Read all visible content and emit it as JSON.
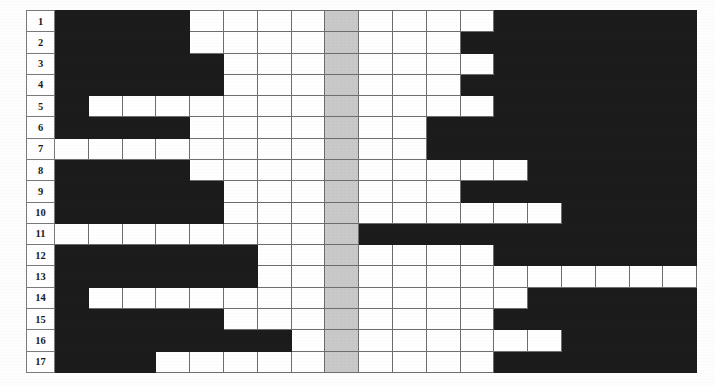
{
  "figure": {
    "kind": "pattern-grid",
    "rows": 17,
    "columns": 19,
    "highlight_column": 9,
    "colors": {
      "filled": "#1c1c1c",
      "empty": "#ffffff",
      "highlight": "#c9c9c9",
      "gridline": "#6e6e6e",
      "label_text": "#1b1b1b",
      "page_background": "#ffffff"
    }
  },
  "row_labels": [
    "1",
    "2",
    "3",
    "4",
    "5",
    "6",
    "7",
    "8",
    "9",
    "10",
    "11",
    "12",
    "13",
    "14",
    "15",
    "16",
    "17"
  ],
  "chart_data": {
    "type": "heatmap",
    "title": "",
    "subtitle": "",
    "xlabel": "",
    "ylabel": "",
    "grid": true,
    "legend_position": "none",
    "x": [
      1,
      2,
      3,
      4,
      5,
      6,
      7,
      8,
      9,
      10,
      11,
      12,
      13,
      14,
      15,
      16,
      17,
      18,
      19
    ],
    "categories": [
      "1",
      "2",
      "3",
      "4",
      "5",
      "6",
      "7",
      "8",
      "9",
      "10",
      "11",
      "12",
      "13",
      "14",
      "15",
      "16",
      "17"
    ],
    "value_meaning": {
      "1": "filled (black)",
      "0": "empty (white)",
      "2": "highlighted center column (gray)"
    },
    "highlight_column_index": 9,
    "values": [
      [
        1,
        1,
        1,
        1,
        0,
        0,
        0,
        0,
        2,
        0,
        0,
        0,
        0,
        1,
        1,
        1,
        1,
        1,
        1
      ],
      [
        1,
        1,
        1,
        1,
        0,
        0,
        0,
        0,
        2,
        0,
        0,
        0,
        1,
        1,
        1,
        1,
        1,
        1,
        1
      ],
      [
        1,
        1,
        1,
        1,
        1,
        0,
        0,
        0,
        2,
        0,
        0,
        0,
        0,
        1,
        1,
        1,
        1,
        1,
        1
      ],
      [
        1,
        1,
        1,
        1,
        1,
        0,
        0,
        0,
        2,
        0,
        0,
        0,
        1,
        1,
        1,
        1,
        1,
        1,
        1
      ],
      [
        1,
        0,
        0,
        0,
        0,
        0,
        0,
        0,
        2,
        0,
        0,
        0,
        0,
        1,
        1,
        1,
        1,
        1,
        1
      ],
      [
        1,
        1,
        1,
        1,
        0,
        0,
        0,
        0,
        2,
        0,
        0,
        1,
        1,
        1,
        1,
        1,
        1,
        1,
        1
      ],
      [
        0,
        0,
        0,
        0,
        0,
        0,
        0,
        0,
        2,
        0,
        0,
        1,
        1,
        1,
        1,
        1,
        1,
        1,
        1
      ],
      [
        1,
        1,
        1,
        1,
        0,
        0,
        0,
        0,
        2,
        0,
        0,
        0,
        0,
        0,
        1,
        1,
        1,
        1,
        1
      ],
      [
        1,
        1,
        1,
        1,
        1,
        0,
        0,
        0,
        2,
        0,
        0,
        0,
        1,
        1,
        1,
        1,
        1,
        1,
        1
      ],
      [
        1,
        1,
        1,
        1,
        1,
        0,
        0,
        0,
        2,
        0,
        0,
        0,
        0,
        0,
        0,
        1,
        1,
        1,
        1
      ],
      [
        0,
        0,
        0,
        0,
        0,
        0,
        0,
        0,
        2,
        1,
        1,
        1,
        1,
        1,
        1,
        1,
        1,
        1,
        1
      ],
      [
        1,
        1,
        1,
        1,
        1,
        1,
        0,
        0,
        2,
        0,
        0,
        0,
        0,
        1,
        1,
        1,
        1,
        1,
        1
      ],
      [
        1,
        1,
        1,
        1,
        1,
        1,
        0,
        0,
        2,
        0,
        0,
        0,
        0,
        0,
        0,
        0,
        0,
        0,
        0
      ],
      [
        1,
        0,
        0,
        0,
        0,
        0,
        0,
        0,
        2,
        0,
        0,
        0,
        0,
        0,
        1,
        1,
        1,
        1,
        1
      ],
      [
        1,
        1,
        1,
        1,
        1,
        0,
        0,
        0,
        2,
        0,
        0,
        0,
        0,
        1,
        1,
        1,
        1,
        1,
        1
      ],
      [
        1,
        1,
        1,
        1,
        1,
        1,
        1,
        0,
        2,
        0,
        0,
        0,
        0,
        0,
        0,
        1,
        1,
        1,
        1
      ],
      [
        1,
        1,
        1,
        0,
        0,
        0,
        0,
        0,
        2,
        0,
        0,
        0,
        0,
        1,
        1,
        1,
        1,
        1,
        1
      ]
    ]
  }
}
